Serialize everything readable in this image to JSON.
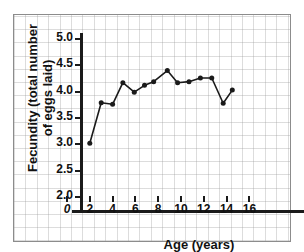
{
  "figure": {
    "scan_artifact_text": "",
    "background_color": "#ffffff",
    "frame_color": "#8c8c8c",
    "ink_color": "#1a1a1a"
  },
  "chart_data": {
    "type": "line",
    "title": "",
    "xlabel": "Age (years)",
    "ylabel": "Fecundity (total number of eggs laid)",
    "ylabel_line1": "Fecundity (total number",
    "ylabel_line2": "of eggs laid)",
    "xlim": [
      0,
      17.5
    ],
    "ylim": [
      2.0,
      5.2
    ],
    "xticks": [
      0,
      2,
      4,
      6,
      8,
      10,
      12,
      14,
      16
    ],
    "xtick_labels": [
      "0",
      "2",
      "4",
      "6",
      "8",
      "10",
      "12",
      "14",
      "16"
    ],
    "yticks": [
      2.0,
      2.5,
      3.0,
      3.5,
      4.0,
      4.5,
      5.0
    ],
    "ytick_labels": [
      "2.0",
      "2.5",
      "3.0",
      "3.5",
      "4.0",
      "4.5",
      "5.0"
    ],
    "grid": true,
    "legend": null,
    "marker": "filled-circle",
    "line_color": "#1a1a1a",
    "marker_color": "#1a1a1a",
    "x": [
      2.0,
      3.0,
      4.0,
      4.9,
      5.9,
      6.8,
      7.6,
      8.8,
      9.7,
      10.7,
      11.7,
      12.7,
      13.7,
      14.5
    ],
    "y": [
      3.02,
      3.79,
      3.76,
      4.17,
      3.99,
      4.12,
      4.19,
      4.4,
      4.17,
      4.19,
      4.26,
      4.26,
      3.78,
      4.03
    ],
    "series": [
      {
        "name": "Fecundity vs Age",
        "points": [
          {
            "x": 2.0,
            "y": 3.02
          },
          {
            "x": 3.0,
            "y": 3.79
          },
          {
            "x": 4.0,
            "y": 3.76
          },
          {
            "x": 4.9,
            "y": 4.17
          },
          {
            "x": 5.9,
            "y": 3.99
          },
          {
            "x": 6.8,
            "y": 4.12
          },
          {
            "x": 7.6,
            "y": 4.19
          },
          {
            "x": 8.8,
            "y": 4.4
          },
          {
            "x": 9.7,
            "y": 4.17
          },
          {
            "x": 10.7,
            "y": 4.19
          },
          {
            "x": 11.7,
            "y": 4.26
          },
          {
            "x": 12.7,
            "y": 4.26
          },
          {
            "x": 13.7,
            "y": 3.78
          },
          {
            "x": 14.5,
            "y": 4.03
          }
        ]
      }
    ]
  }
}
